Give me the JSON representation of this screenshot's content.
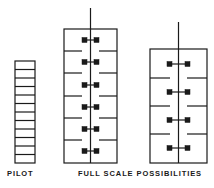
{
  "figure": {
    "width": 214,
    "height": 188,
    "background": "#ffffff",
    "ink_color": "#1a1a1a",
    "stroke_width": 1.2
  },
  "labels": [
    {
      "id": "pilot",
      "text": "PILOT",
      "x": 7,
      "y": 169
    },
    {
      "id": "fullscale",
      "text": "FULL SCALE POSSIBILITIES",
      "x": 78,
      "y": 169
    }
  ],
  "pilot_column": {
    "name": "pilot",
    "label": "PILOT",
    "x": 15,
    "y": 61,
    "width": 20,
    "height": 102,
    "cell_count": 12,
    "cell_height": 8.5
  },
  "diagrams": [
    {
      "name": "full-scale-option-a",
      "x": 64,
      "y": 29,
      "width": 53,
      "height": 134,
      "center_line_top": 8,
      "center_line_bottom": 163,
      "marker_pair_count": 6,
      "marker_size": 5,
      "marker_offset": 6,
      "marker_ys": [
        40,
        62,
        85,
        107,
        129,
        151
      ],
      "tick_length": 18,
      "ticks": [
        {
          "side": "left",
          "y": 51
        },
        {
          "side": "right",
          "y": 51
        },
        {
          "side": "left",
          "y": 73
        },
        {
          "side": "right",
          "y": 73
        },
        {
          "side": "left",
          "y": 96
        },
        {
          "side": "right",
          "y": 96
        },
        {
          "side": "left",
          "y": 118
        },
        {
          "side": "right",
          "y": 118
        },
        {
          "side": "left",
          "y": 140
        },
        {
          "side": "right",
          "y": 140
        }
      ]
    },
    {
      "name": "full-scale-option-b",
      "x": 150,
      "y": 49,
      "width": 57,
      "height": 114,
      "center_line_top": 22,
      "center_line_bottom": 163,
      "marker_pair_count": 4,
      "marker_size": 5,
      "marker_offset": 9,
      "marker_ys": [
        64,
        92,
        120,
        148
      ],
      "tick_length": 20,
      "ticks": [
        {
          "side": "left",
          "y": 78
        },
        {
          "side": "right",
          "y": 78
        },
        {
          "side": "left",
          "y": 106
        },
        {
          "side": "right",
          "y": 106
        },
        {
          "side": "left",
          "y": 134
        },
        {
          "side": "right",
          "y": 134
        }
      ]
    }
  ]
}
